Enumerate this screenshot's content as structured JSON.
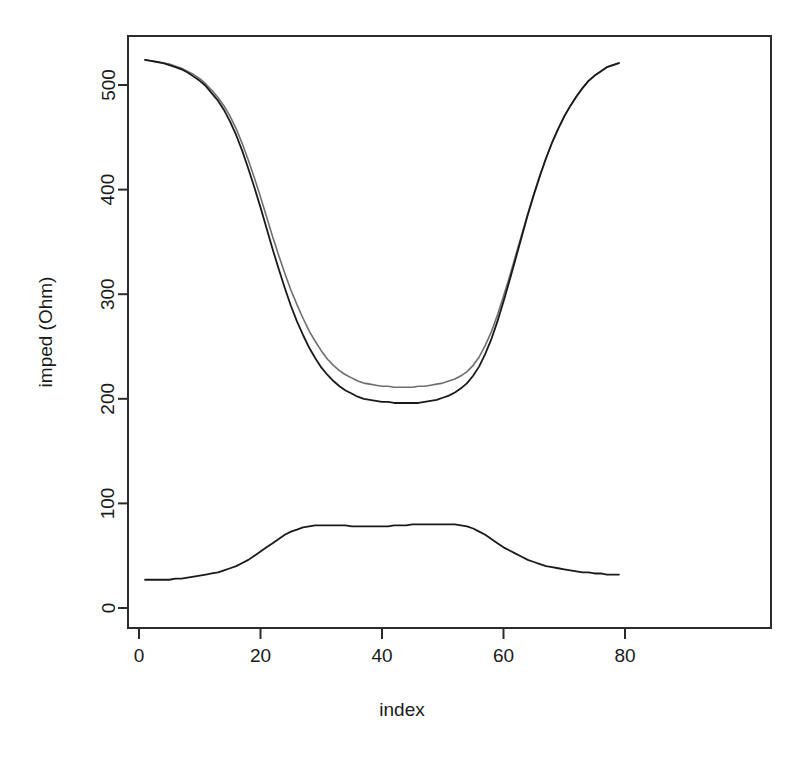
{
  "chart_data": {
    "type": "line",
    "title": "",
    "xlabel": "index",
    "ylabel": "imped (Ohm)",
    "xlim": [
      1,
      80
    ],
    "ylim": [
      0,
      540
    ],
    "grid": false,
    "legend": "none",
    "xticks": [
      0,
      20,
      40,
      60,
      80
    ],
    "yticks": [
      0,
      100,
      200,
      300,
      400,
      500
    ],
    "x": [
      1,
      2,
      3,
      4,
      5,
      6,
      7,
      8,
      9,
      10,
      11,
      12,
      13,
      14,
      15,
      16,
      17,
      18,
      19,
      20,
      21,
      22,
      23,
      24,
      25,
      26,
      27,
      28,
      29,
      30,
      31,
      32,
      33,
      34,
      35,
      36,
      37,
      38,
      39,
      40,
      41,
      42,
      43,
      44,
      45,
      46,
      47,
      48,
      49,
      50,
      51,
      52,
      53,
      54,
      55,
      56,
      57,
      58,
      59,
      60,
      61,
      62,
      63,
      64,
      65,
      66,
      67,
      68,
      69,
      70,
      71,
      72,
      73,
      74,
      75,
      76,
      77,
      78,
      79
    ],
    "series": [
      {
        "name": "imped-upper-gray",
        "color": "#6e6e6e",
        "width": 1.6,
        "values": [
          524,
          523,
          522,
          521,
          520,
          518,
          516,
          513,
          510,
          506,
          501,
          495,
          488,
          480,
          470,
          458,
          444,
          428,
          411,
          393,
          374,
          355,
          337,
          320,
          304,
          290,
          277,
          265,
          255,
          246,
          238,
          232,
          227,
          223,
          220,
          217,
          215,
          214,
          213,
          212,
          212,
          211,
          211,
          211,
          211,
          212,
          212,
          213,
          214,
          215,
          217,
          219,
          222,
          226,
          232,
          240,
          251,
          264,
          280,
          298,
          317,
          337,
          357,
          377,
          396,
          414,
          430,
          445,
          458,
          470,
          480,
          489,
          497,
          504,
          509,
          513,
          517,
          519,
          521
        ]
      },
      {
        "name": "imped-lower-black",
        "color": "#1a1a1a",
        "width": 1.8,
        "values": [
          524,
          523,
          522,
          521,
          519,
          517,
          515,
          512,
          508,
          504,
          499,
          492,
          485,
          476,
          465,
          452,
          437,
          420,
          402,
          383,
          363,
          343,
          324,
          306,
          289,
          274,
          261,
          249,
          239,
          230,
          223,
          217,
          212,
          208,
          205,
          202,
          200,
          199,
          198,
          197,
          197,
          196,
          196,
          196,
          196,
          196,
          197,
          198,
          199,
          201,
          203,
          206,
          210,
          215,
          222,
          231,
          243,
          257,
          274,
          293,
          313,
          334,
          355,
          376,
          395,
          413,
          430,
          445,
          458,
          470,
          480,
          489,
          497,
          504,
          509,
          513,
          517,
          519,
          521
        ]
      },
      {
        "name": "phase-lower-curve",
        "color": "#1a1a1a",
        "width": 1.8,
        "values": [
          27,
          27,
          27,
          27,
          27,
          28,
          28,
          29,
          30,
          31,
          32,
          33,
          34,
          36,
          38,
          40,
          43,
          46,
          50,
          54,
          58,
          62,
          66,
          70,
          73,
          75,
          77,
          78,
          79,
          79,
          79,
          79,
          79,
          79,
          78,
          78,
          78,
          78,
          78,
          78,
          78,
          79,
          79,
          79,
          80,
          80,
          80,
          80,
          80,
          80,
          80,
          80,
          79,
          78,
          76,
          73,
          70,
          66,
          62,
          58,
          55,
          52,
          49,
          46,
          44,
          42,
          40,
          39,
          38,
          37,
          36,
          35,
          34,
          34,
          33,
          33,
          32,
          32,
          32
        ]
      }
    ]
  },
  "axes": {
    "x_axis_name": "x-axis",
    "y_axis_name": "y-axis"
  }
}
